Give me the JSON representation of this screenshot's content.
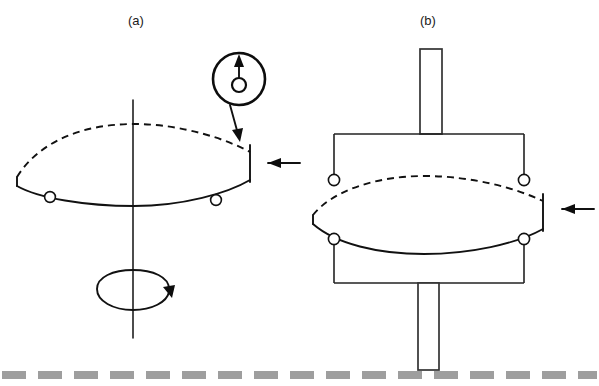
{
  "figure": {
    "background_color": "#ffffff",
    "line_color": "#111111",
    "ground_color": "#9e9e9e",
    "width": 599,
    "height": 386
  },
  "panels": [
    {
      "id": "a",
      "label": "(a)",
      "label_x": 128,
      "label_y": 24,
      "description": "Disc on vertical spin axis with two lower rollers, rotation arrow below, detail callout above right",
      "parts": {
        "disc_label": "lens-shaped disc",
        "axis_label": "vertical spin axis",
        "rollers": 2,
        "rotation_arrow": "counter-rotation ellipse arrow",
        "load_arrow": "horizontal inward arrow at disc rim",
        "callout": "roller detail inset"
      }
    },
    {
      "id": "b",
      "label": "(b)",
      "label_x": 420,
      "label_y": 24,
      "description": "Disc held between upper and lower bracket frames with four rollers and vertical shafts top and bottom",
      "parts": {
        "disc_label": "lens-shaped disc",
        "upper_shaft": "upper vertical shaft",
        "lower_shaft": "lower vertical shaft",
        "upper_bracket": "upper roller carrier frame",
        "lower_bracket": "lower roller carrier frame",
        "rollers": 4,
        "load_arrow": "horizontal inward arrow at disc rim"
      }
    }
  ],
  "callout": {
    "name": "roller-detail-inset",
    "description": "Magnified circular detail of a roller showing hub and upward contact force arrow",
    "center_x": 239,
    "center_y": 79,
    "radius": 26,
    "hub_radius": 7,
    "force_arrow": "upward"
  },
  "ground": {
    "name": "ground-reference-line",
    "style": "dashed",
    "color": "#9e9e9e",
    "y": 375
  },
  "icons": {
    "load_arrow_icon": "arrow-left-icon",
    "rotation_arrow_icon": "rotation-arrow-icon",
    "force_arrow_icon": "arrow-up-icon",
    "callout_leader_icon": "leader-arrow-icon"
  }
}
